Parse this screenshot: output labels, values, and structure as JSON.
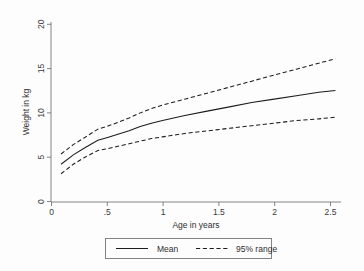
{
  "chart_data": {
    "type": "line",
    "title": "",
    "xlabel": "Age in years",
    "ylabel": "Weight in kg",
    "xlim": [
      0,
      2.6
    ],
    "ylim": [
      0,
      21
    ],
    "xticks": [
      "0",
      ".5",
      "1",
      "1.5",
      "2",
      "2.5"
    ],
    "xtick_values": [
      0,
      0.5,
      1,
      1.5,
      2,
      2.5
    ],
    "yticks": [
      "0",
      "5",
      "10",
      "15",
      "20"
    ],
    "ytick_values": [
      0,
      5,
      10,
      15,
      20
    ],
    "grid": false,
    "legend_position": "below-plot",
    "x": [
      0.09,
      0.2,
      0.3,
      0.42,
      0.5,
      0.6,
      0.7,
      0.8,
      0.9,
      1.0,
      1.2,
      1.4,
      1.6,
      1.8,
      2.0,
      2.2,
      2.4,
      2.55
    ],
    "series": [
      {
        "name": "Mean",
        "style": "solid",
        "values": [
          4.4,
          5.5,
          6.3,
          7.2,
          7.5,
          7.9,
          8.3,
          8.8,
          9.2,
          9.5,
          10.1,
          10.6,
          11.1,
          11.6,
          12.0,
          12.4,
          12.8,
          13.0
        ]
      },
      {
        "name": "95% range upper",
        "style": "dashed",
        "values": [
          5.6,
          6.7,
          7.5,
          8.5,
          8.8,
          9.3,
          9.8,
          10.4,
          10.9,
          11.3,
          12.0,
          12.7,
          13.4,
          14.1,
          14.8,
          15.5,
          16.2,
          16.7
        ]
      },
      {
        "name": "95% range lower",
        "style": "dashed",
        "values": [
          3.3,
          4.4,
          5.2,
          6.0,
          6.2,
          6.5,
          6.8,
          7.1,
          7.4,
          7.6,
          8.0,
          8.3,
          8.6,
          8.9,
          9.2,
          9.5,
          9.7,
          9.9
        ]
      }
    ],
    "legend": [
      {
        "label": "Mean",
        "style": "solid"
      },
      {
        "label": "95% range",
        "style": "dashed"
      }
    ]
  }
}
